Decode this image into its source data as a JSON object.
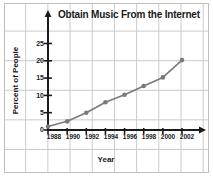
{
  "chart_data": {
    "type": "line",
    "title": "Obtain Music From the Internet",
    "xlabel": "Year",
    "ylabel": "Percent of People",
    "x": [
      1988,
      1990,
      1992,
      1994,
      1996,
      1998,
      2000,
      2002
    ],
    "values": [
      1,
      2.5,
      5,
      8,
      10.2,
      12.7,
      15.2,
      20.2
    ],
    "xticklabels": [
      "1988",
      "1990",
      "1992",
      "1994",
      "1996",
      "1998",
      "2000",
      "2002"
    ],
    "yticklabels": [
      "0",
      "5",
      "10",
      "15",
      "20",
      "25"
    ],
    "yticks": [
      0,
      5,
      10,
      15,
      20,
      25
    ],
    "xlim": [
      1987,
      2003
    ],
    "ylim": [
      0,
      26
    ],
    "grid": true,
    "legend": false,
    "series_color": "#7a7a7a",
    "marker": "circle",
    "axis_color": "#1a1a1a",
    "grid_color": "#c9c9c9"
  }
}
